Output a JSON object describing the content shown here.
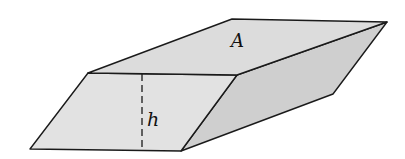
{
  "diagram": {
    "labels": {
      "area": "A",
      "height": "h"
    },
    "colors": {
      "background": "#ffffff",
      "top_face": "#dcdcdc",
      "front_face": "#e2e2e2",
      "right_face": "#cfcfcf",
      "edge": "#1a1a1a"
    }
  }
}
